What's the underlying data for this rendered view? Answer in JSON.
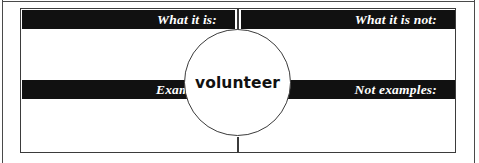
{
  "organizer": {
    "type": "frayer-model",
    "center_term": "volunteer",
    "quadrants": [
      {
        "id": "what-it-is",
        "label": "What it is:",
        "position": "top-left",
        "content": ""
      },
      {
        "id": "what-it-is-not",
        "label": "What it is not:",
        "position": "top-right",
        "content": ""
      },
      {
        "id": "examples",
        "label": "Examples:",
        "position": "bottom-left",
        "content": ""
      },
      {
        "id": "not-examples",
        "label": "Not examples:",
        "position": "bottom-right",
        "content": ""
      }
    ]
  },
  "colors": {
    "band_background": "#111111",
    "band_text": "#ffffff",
    "border": "#3b3b3b",
    "outer_border": "#4a4a4a",
    "page_background": "#ffffff",
    "center_text": "#111111"
  }
}
